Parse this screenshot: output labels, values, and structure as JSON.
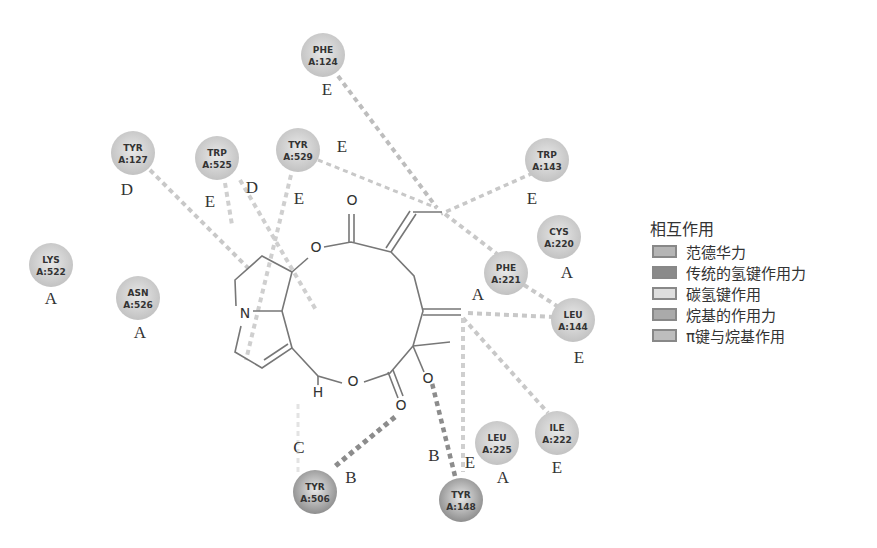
{
  "legend": {
    "title": "相互作用",
    "items": [
      {
        "key": "A",
        "label": "范德华力",
        "color": "#b5b5b5"
      },
      {
        "key": "B",
        "label": "传统的氢键作用力",
        "color": "#8a8a8a"
      },
      {
        "key": "C",
        "label": "碳氢键作用",
        "color": "#dedede"
      },
      {
        "key": "D",
        "label": "烷基的作用力",
        "color": "#aaaaaa"
      },
      {
        "key": "E",
        "label": "π键与烷基作用",
        "color": "#bdbdbd"
      }
    ]
  },
  "residues": [
    {
      "name": "PHE",
      "id": "A:124",
      "x": 323,
      "y": 55,
      "type": "E",
      "lx": 327,
      "ly": 95,
      "color": "#c2c2c2"
    },
    {
      "name": "TYR",
      "id": "A:127",
      "x": 133,
      "y": 153,
      "type": "D",
      "lx": 127,
      "ly": 195,
      "color": "#c2c2c2"
    },
    {
      "name": "TRP",
      "id": "A:525",
      "x": 217,
      "y": 158,
      "type": "E",
      "lx": 210,
      "ly": 207,
      "color": "#c2c2c2"
    },
    {
      "name": "TYR",
      "id": "A:529",
      "x": 298,
      "y": 150,
      "type": "E",
      "lx": 299,
      "ly": 204,
      "color": "#c2c2c2"
    },
    {
      "name": "TRP",
      "id": "A:143",
      "x": 547,
      "y": 160,
      "type": "E",
      "lx": 532,
      "ly": 204,
      "color": "#c2c2c2"
    },
    {
      "name": "CYS",
      "id": "A:220",
      "x": 559,
      "y": 237,
      "type": "A",
      "lx": 567,
      "ly": 278,
      "color": "#c2c2c2"
    },
    {
      "name": "PHE",
      "id": "A:221",
      "x": 506,
      "y": 273,
      "type": "A",
      "lx": 478,
      "ly": 300,
      "color": "#c2c2c2"
    },
    {
      "name": "LEU",
      "id": "A:144",
      "x": 573,
      "y": 320,
      "type": "E",
      "lx": 579,
      "ly": 363,
      "color": "#c2c2c2"
    },
    {
      "name": "LYS",
      "id": "A:522",
      "x": 51,
      "y": 265,
      "type": "A",
      "lx": 51,
      "ly": 304,
      "color": "#c2c2c2"
    },
    {
      "name": "ASN",
      "id": "A:526",
      "x": 138,
      "y": 298,
      "type": "A",
      "lx": 140,
      "ly": 338,
      "color": "#c2c2c2"
    },
    {
      "name": "ILE",
      "id": "A:222",
      "x": 557,
      "y": 433,
      "type": "E",
      "lx": 557,
      "ly": 473,
      "color": "#c2c2c2"
    },
    {
      "name": "LEU",
      "id": "A:225",
      "x": 497,
      "y": 443,
      "type": "A",
      "lx": 503,
      "ly": 483,
      "color": "#c2c2c2"
    },
    {
      "name": "TYR",
      "id": "A:506",
      "x": 315,
      "y": 492,
      "type": "B",
      "lx": 351,
      "ly": 483,
      "color": "#8e8e8e"
    },
    {
      "name": "TYR",
      "id": "A:148",
      "x": 461,
      "y": 500,
      "type": "B",
      "lx": 434,
      "ly": 461,
      "color": "#8e8e8e"
    }
  ],
  "extra_labels": [
    {
      "text": "C",
      "x": 299,
      "y": 453
    },
    {
      "text": "E",
      "x": 470,
      "y": 468
    },
    {
      "text": "E",
      "x": 342,
      "y": 152
    },
    {
      "text": "D",
      "x": 252,
      "y": 193
    }
  ],
  "interactions": [
    {
      "from": [
        338,
        76
      ],
      "to": [
        437,
        208
      ],
      "color": "#bdbdbd",
      "width": 4
    },
    {
      "from": [
        318,
        160
      ],
      "to": [
        437,
        208
      ],
      "color": "#c8c8c8",
      "width": 3
    },
    {
      "from": [
        533,
        173
      ],
      "to": [
        441,
        214
      ],
      "color": "#c8c8c8",
      "width": 3.5
    },
    {
      "from": [
        445,
        214
      ],
      "to": [
        497,
        254
      ],
      "color": "#c8c8c8",
      "width": 4
    },
    {
      "from": [
        150,
        170
      ],
      "to": [
        248,
        268
      ],
      "color": "#c8c8c8",
      "width": 4
    },
    {
      "from": [
        225,
        183
      ],
      "to": [
        232,
        225
      ],
      "color": "#cfcfcf",
      "width": 4
    },
    {
      "from": [
        240,
        180
      ],
      "to": [
        316,
        310
      ],
      "color": "#cfcfcf",
      "width": 4
    },
    {
      "from": [
        291,
        175
      ],
      "to": [
        246,
        360
      ],
      "color": "#cfcfcf",
      "width": 4
    },
    {
      "from": [
        524,
        285
      ],
      "to": [
        557,
        306
      ],
      "color": "#c8c8c8",
      "width": 4
    },
    {
      "from": [
        468,
        313
      ],
      "to": [
        554,
        317
      ],
      "color": "#c8c8c8",
      "width": 4
    },
    {
      "from": [
        463,
        318
      ],
      "to": [
        548,
        413
      ],
      "color": "#c8c8c8",
      "width": 4
    },
    {
      "from": [
        463,
        318
      ],
      "to": [
        463,
        472
      ],
      "color": "#cfcfcf",
      "width": 4
    },
    {
      "from": [
        298,
        404
      ],
      "to": [
        298,
        472
      ],
      "color": "#e3e3e3",
      "width": 3
    },
    {
      "from": [
        395,
        417
      ],
      "to": [
        333,
        468
      ],
      "color": "#8c8c8c",
      "width": 5
    },
    {
      "from": [
        430,
        375
      ],
      "to": [
        455,
        476
      ],
      "color": "#8c8c8c",
      "width": 4.5
    }
  ],
  "molecule": {
    "atoms": [
      {
        "symbol": "O",
        "x": 352,
        "y": 205
      },
      {
        "symbol": "O",
        "x": 316,
        "y": 252
      },
      {
        "symbol": "N",
        "x": 245,
        "y": 318
      },
      {
        "symbol": "H",
        "x": 318,
        "y": 397
      },
      {
        "symbol": "O",
        "x": 353,
        "y": 386
      },
      {
        "symbol": "O",
        "x": 401,
        "y": 410
      },
      {
        "symbol": "O",
        "x": 428,
        "y": 383
      }
    ]
  }
}
